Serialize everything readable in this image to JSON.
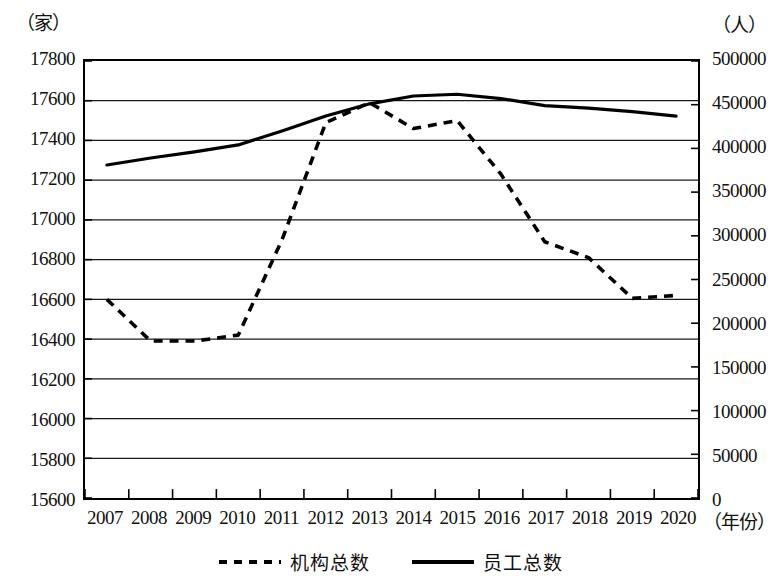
{
  "chart_data": {
    "type": "line",
    "title": "",
    "xlabel": "（年份）",
    "ylabel": "（家）",
    "y2label": "（人）",
    "x": [
      "2007",
      "2008",
      "2009",
      "2010",
      "2011",
      "2012",
      "2013",
      "2014",
      "2015",
      "2016",
      "2017",
      "2018",
      "2019",
      "2020"
    ],
    "categories": [
      "2007",
      "2008",
      "2009",
      "2010",
      "2011",
      "2012",
      "2013",
      "2014",
      "2015",
      "2016",
      "2017",
      "2018",
      "2019",
      "2020"
    ],
    "xtick_labels": [
      "2007",
      "2008",
      "2009",
      "2010",
      "2011",
      "2012",
      "2013",
      "2014",
      "2015",
      "2016",
      "2017",
      "2018",
      "2019",
      "2020"
    ],
    "ylim": [
      15600,
      17800
    ],
    "ytick_labels": [
      "17800",
      "17600",
      "17400",
      "17200",
      "17000",
      "16800",
      "16600",
      "16400",
      "16200",
      "16000",
      "15800",
      "15600"
    ],
    "ytick_values": [
      17800,
      17600,
      17400,
      17200,
      17000,
      16800,
      16600,
      16400,
      16200,
      16000,
      15800,
      15600
    ],
    "y2lim": [
      0,
      500000
    ],
    "y2tick_labels": [
      "500000",
      "450000",
      "400000",
      "350000",
      "300000",
      "250000",
      "200000",
      "150000",
      "100000",
      "50000",
      "0"
    ],
    "y2tick_values": [
      500000,
      450000,
      400000,
      350000,
      300000,
      250000,
      200000,
      150000,
      100000,
      50000,
      0
    ],
    "grid": true,
    "legend_position": "bottom",
    "series": [
      {
        "name": "机构总数",
        "axis": "left",
        "style": "dashed",
        "color": "#000000",
        "values": [
          16600,
          16390,
          16390,
          16420,
          16900,
          17490,
          17590,
          17460,
          17500,
          17230,
          16890,
          16810,
          16605,
          16620
        ]
      },
      {
        "name": "员工总数",
        "axis": "right",
        "style": "solid",
        "color": "#000000",
        "values": [
          381000,
          389000,
          396000,
          404000,
          420000,
          437000,
          451000,
          460000,
          462000,
          457000,
          449000,
          446000,
          442000,
          437000
        ]
      }
    ]
  },
  "legend": {
    "items": [
      {
        "label": "机构总数",
        "style": "dashed"
      },
      {
        "label": "员工总数",
        "style": "solid"
      }
    ]
  }
}
